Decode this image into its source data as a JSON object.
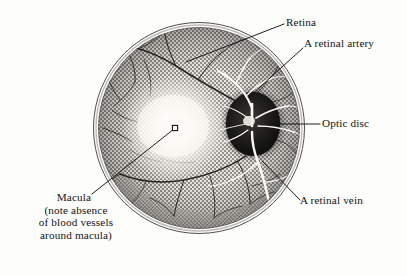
{
  "figure": {
    "background_color": "#fdfdfc",
    "ink_color": "#141414"
  },
  "eye": {
    "fundus_circle": {
      "center_x": 199,
      "center_y": 128,
      "radius": 102,
      "outer_ring_radius": 105,
      "ring_color": "#2b2b2b"
    },
    "optic_disc": {
      "center_x": 254,
      "center_y": 124,
      "radius_x": 27,
      "radius_y": 32,
      "fill_color": "#1a1a1a"
    },
    "macula": {
      "center_x": 175,
      "center_y": 128,
      "glow_radius": 52,
      "fovea_x": 175,
      "fovea_y": 128,
      "fovea_size": 4,
      "fill_color": "#fbfaf7"
    }
  },
  "labels": {
    "retina": "Retina",
    "retinal_artery": "A retinal artery",
    "optic_disc": "Optic disc",
    "retinal_vein": "A retinal vein",
    "macula_title": "Macula",
    "macula_note_line1": "(note absence",
    "macula_note_line2": "of blood vessels",
    "macula_note_line3": "around macula)"
  },
  "leader_lines": [
    {
      "name": "retina-leader",
      "x1": 186,
      "y1": 62,
      "x2": 284,
      "y2": 24
    },
    {
      "name": "artery-leader",
      "x1": 249,
      "y1": 97,
      "x2": 303,
      "y2": 48
    },
    {
      "name": "optic-disc-leader",
      "x1": 269,
      "y1": 124,
      "x2": 320,
      "y2": 124
    },
    {
      "name": "vein-leader",
      "x1": 262,
      "y1": 161,
      "x2": 300,
      "y2": 200
    },
    {
      "name": "macula-leader",
      "x1": 174,
      "y1": 129,
      "x2": 92,
      "y2": 194
    }
  ]
}
